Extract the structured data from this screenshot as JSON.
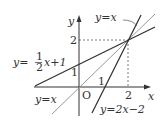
{
  "axes": {
    "x_label": "x",
    "y_label": "y",
    "origin_label": "O",
    "x_ticks": [
      "1",
      "2"
    ],
    "y_ticks": [
      "1",
      "2"
    ]
  },
  "lines": [
    {
      "name": "line-half-x-plus-1",
      "label_prefix": "y=",
      "frac_num": "1",
      "frac_den": "2",
      "label_suffix": "x+1",
      "color": "#333333"
    },
    {
      "name": "line-y-equals-x",
      "label": "y=x",
      "color": "#999999"
    },
    {
      "name": "line-2x-minus-2",
      "label": "y=2x−2",
      "color": "#333333"
    }
  ],
  "annotations": {
    "top_label": "y=x",
    "bottom_left_label": "y=x"
  },
  "intersection": {
    "x": "2",
    "y": "2"
  }
}
